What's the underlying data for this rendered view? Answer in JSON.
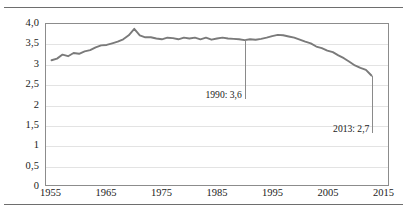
{
  "chart_data": {
    "type": "line",
    "title": "",
    "subtitle": "",
    "xlabel": "",
    "ylabel": "",
    "xlim": [
      1954,
      2016
    ],
    "ylim": [
      0,
      4.0
    ],
    "grid": true,
    "legend": "none",
    "y_ticks": [
      "0",
      "0,5",
      "1",
      "1,5",
      "2",
      "2,5",
      "3",
      "3,5",
      "4,0"
    ],
    "y_tick_values": [
      0,
      0.5,
      1,
      1.5,
      2,
      2.5,
      3,
      3.5,
      4.0
    ],
    "x_ticks": [
      "1955",
      "1965",
      "1975",
      "1985",
      "1995",
      "2005",
      "2015"
    ],
    "x_tick_values": [
      1955,
      1965,
      1975,
      1985,
      1995,
      2005,
      2015
    ],
    "series": [
      {
        "name": "value",
        "color": "#7a7a7a",
        "x": [
          1955,
          1956,
          1957,
          1958,
          1959,
          1960,
          1961,
          1962,
          1963,
          1964,
          1965,
          1966,
          1967,
          1968,
          1969,
          1970,
          1971,
          1972,
          1973,
          1974,
          1975,
          1976,
          1977,
          1978,
          1979,
          1980,
          1981,
          1982,
          1983,
          1984,
          1985,
          1986,
          1987,
          1988,
          1989,
          1990,
          1991,
          1992,
          1993,
          1994,
          1995,
          1996,
          1997,
          1998,
          1999,
          2000,
          2001,
          2002,
          2003,
          2004,
          2005,
          2006,
          2007,
          2008,
          2009,
          2010,
          2011,
          2012,
          2013
        ],
        "values": [
          3.1,
          3.14,
          3.24,
          3.2,
          3.28,
          3.26,
          3.32,
          3.35,
          3.42,
          3.47,
          3.48,
          3.52,
          3.56,
          3.62,
          3.72,
          3.88,
          3.72,
          3.67,
          3.67,
          3.64,
          3.62,
          3.66,
          3.65,
          3.62,
          3.66,
          3.64,
          3.66,
          3.62,
          3.66,
          3.61,
          3.64,
          3.66,
          3.64,
          3.63,
          3.62,
          3.6,
          3.62,
          3.61,
          3.63,
          3.66,
          3.7,
          3.73,
          3.72,
          3.69,
          3.66,
          3.61,
          3.56,
          3.52,
          3.44,
          3.4,
          3.34,
          3.3,
          3.22,
          3.15,
          3.06,
          2.97,
          2.91,
          2.86,
          2.72
        ]
      }
    ],
    "annotations": [
      {
        "id": "annotation-1990",
        "label": "1990: 3,6",
        "x": 1990,
        "y": 3.6
      },
      {
        "id": "annotation-2013",
        "label": "2013: 2,7",
        "x": 2013,
        "y": 2.7
      }
    ]
  },
  "colors": {
    "line": "#7a7a7a",
    "grid": "#e3e3e3",
    "frame": "#8c8c8c",
    "rule": "#6e6e6e",
    "text": "#1a1a1a"
  }
}
